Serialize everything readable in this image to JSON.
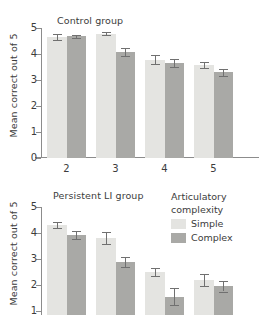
{
  "figure": {
    "ylabel": "Mean correct out of 5"
  },
  "legend": {
    "title_line1": "Articulatory",
    "title_line2": "complexity",
    "items": [
      {
        "label": "Simple",
        "color": "#e4e4e1"
      },
      {
        "label": "Complex",
        "color": "#a9a9a6"
      }
    ]
  },
  "chart_data": [
    {
      "type": "bar",
      "title": "Control group",
      "xlabel": "",
      "ylabel": "Mean correct out of 5",
      "categories": [
        "2",
        "3",
        "4",
        "5"
      ],
      "ylim": [
        0,
        5
      ],
      "yticks": [
        "0",
        "1",
        "2",
        "3",
        "4",
        "5"
      ],
      "grid": false,
      "legend_position": "none",
      "series": [
        {
          "name": "Simple",
          "color": "#e4e4e1",
          "values": [
            4.65,
            4.78,
            3.78,
            3.58
          ],
          "errors": [
            0.13,
            0.06,
            0.17,
            0.12
          ]
        },
        {
          "name": "Complex",
          "color": "#a9a9a6",
          "values": [
            4.68,
            4.08,
            3.65,
            3.3
          ],
          "errors": [
            0.07,
            0.16,
            0.14,
            0.14
          ]
        }
      ]
    },
    {
      "type": "bar",
      "title": "Persistent LI group",
      "xlabel": "",
      "ylabel": "Mean correct out of 5",
      "categories": [
        "2",
        "3",
        "4",
        "5"
      ],
      "ylim": [
        0,
        5
      ],
      "yticks": [
        "1",
        "2",
        "3",
        "4",
        "5"
      ],
      "grid": false,
      "legend_position": "right",
      "series": [
        {
          "name": "Simple",
          "color": "#e4e4e1",
          "values": [
            4.3,
            3.8,
            2.5,
            2.2
          ],
          "errors": [
            0.12,
            0.22,
            0.14,
            0.24
          ]
        },
        {
          "name": "Complex",
          "color": "#a9a9a6",
          "values": [
            3.92,
            2.87,
            1.55,
            1.95
          ],
          "errors": [
            0.14,
            0.19,
            0.32,
            0.2
          ]
        }
      ]
    }
  ]
}
